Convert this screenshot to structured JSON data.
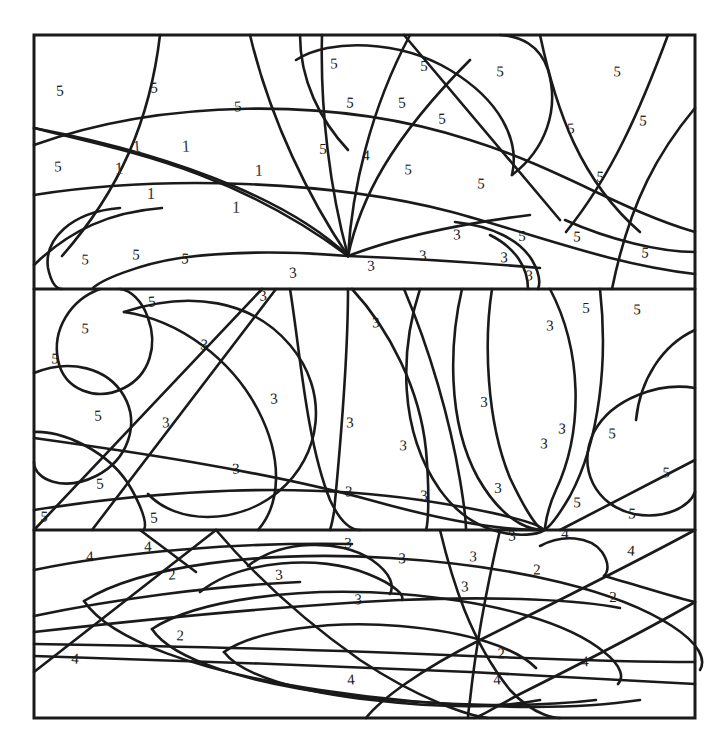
{
  "page": {
    "background_color": "#ffffff",
    "line_color": "#1a1a1a",
    "number_color": "#1a1a1a",
    "width": 727,
    "height": 754
  },
  "frame": {
    "left": 34,
    "top": 35,
    "right": 695,
    "bottom": 718,
    "divider_1_y": 289,
    "divider_2_y": 530
  },
  "legend": {
    "codes": [
      "1",
      "2",
      "3",
      "4",
      "5"
    ]
  },
  "numbers": [
    {
      "value": "5",
      "x": 60,
      "y": 92
    },
    {
      "value": "5",
      "x": 154,
      "y": 89
    },
    {
      "value": "5",
      "x": 238,
      "y": 108
    },
    {
      "value": "5",
      "x": 334,
      "y": 65
    },
    {
      "value": "5",
      "x": 424,
      "y": 68
    },
    {
      "value": "5",
      "x": 500,
      "y": 73
    },
    {
      "value": "5",
      "x": 617,
      "y": 73
    },
    {
      "value": "5",
      "x": 643,
      "y": 122
    },
    {
      "value": "5",
      "x": 350,
      "y": 104
    },
    {
      "value": "5",
      "x": 402,
      "y": 104
    },
    {
      "value": "5",
      "x": 442,
      "y": 120
    },
    {
      "value": "5",
      "x": 571,
      "y": 130
    },
    {
      "value": "5",
      "x": 58,
      "y": 168
    },
    {
      "value": "5",
      "x": 323,
      "y": 151
    },
    {
      "value": "4",
      "x": 366,
      "y": 157
    },
    {
      "value": "5",
      "x": 408,
      "y": 171
    },
    {
      "value": "5",
      "x": 481,
      "y": 185
    },
    {
      "value": "5",
      "x": 600,
      "y": 178
    },
    {
      "value": "1",
      "x": 137,
      "y": 148
    },
    {
      "value": "1",
      "x": 186,
      "y": 148
    },
    {
      "value": "1",
      "x": 119,
      "y": 170
    },
    {
      "value": "1",
      "x": 259,
      "y": 172
    },
    {
      "value": "1",
      "x": 151,
      "y": 195
    },
    {
      "value": "1",
      "x": 236,
      "y": 209
    },
    {
      "value": "5",
      "x": 85,
      "y": 261
    },
    {
      "value": "5",
      "x": 136,
      "y": 256
    },
    {
      "value": "5",
      "x": 185,
      "y": 260
    },
    {
      "value": "3",
      "x": 293,
      "y": 274
    },
    {
      "value": "3",
      "x": 371,
      "y": 267
    },
    {
      "value": "3",
      "x": 423,
      "y": 257
    },
    {
      "value": "3",
      "x": 457,
      "y": 236
    },
    {
      "value": "5",
      "x": 522,
      "y": 238
    },
    {
      "value": "3",
      "x": 504,
      "y": 259
    },
    {
      "value": "3",
      "x": 529,
      "y": 277
    },
    {
      "value": "5",
      "x": 577,
      "y": 238
    },
    {
      "value": "5",
      "x": 645,
      "y": 254
    },
    {
      "value": "5",
      "x": 152,
      "y": 303
    },
    {
      "value": "3",
      "x": 263,
      "y": 297
    },
    {
      "value": "3",
      "x": 376,
      "y": 324
    },
    {
      "value": "3",
      "x": 550,
      "y": 327
    },
    {
      "value": "5",
      "x": 586,
      "y": 310
    },
    {
      "value": "5",
      "x": 637,
      "y": 311
    },
    {
      "value": "5",
      "x": 85,
      "y": 330
    },
    {
      "value": "5",
      "x": 55,
      "y": 360
    },
    {
      "value": "3",
      "x": 204,
      "y": 346
    },
    {
      "value": "3",
      "x": 274,
      "y": 400
    },
    {
      "value": "5",
      "x": 98,
      "y": 417
    },
    {
      "value": "3",
      "x": 166,
      "y": 424
    },
    {
      "value": "3",
      "x": 350,
      "y": 424
    },
    {
      "value": "3",
      "x": 484,
      "y": 404
    },
    {
      "value": "5",
      "x": 612,
      "y": 435
    },
    {
      "value": "3",
      "x": 403,
      "y": 447
    },
    {
      "value": "3",
      "x": 544,
      "y": 445
    },
    {
      "value": "3",
      "x": 562,
      "y": 430
    },
    {
      "value": "5",
      "x": 100,
      "y": 485
    },
    {
      "value": "3",
      "x": 236,
      "y": 470
    },
    {
      "value": "3",
      "x": 349,
      "y": 493
    },
    {
      "value": "3",
      "x": 424,
      "y": 497
    },
    {
      "value": "3",
      "x": 498,
      "y": 490
    },
    {
      "value": "5",
      "x": 577,
      "y": 504
    },
    {
      "value": "5",
      "x": 666,
      "y": 474
    },
    {
      "value": "5",
      "x": 632,
      "y": 515
    },
    {
      "value": "5",
      "x": 44,
      "y": 518
    },
    {
      "value": "5",
      "x": 154,
      "y": 519
    },
    {
      "value": "3",
      "x": 512,
      "y": 537
    },
    {
      "value": "4",
      "x": 90,
      "y": 558
    },
    {
      "value": "4",
      "x": 148,
      "y": 548
    },
    {
      "value": "3",
      "x": 348,
      "y": 545
    },
    {
      "value": "3",
      "x": 402,
      "y": 560
    },
    {
      "value": "3",
      "x": 473,
      "y": 558
    },
    {
      "value": "4",
      "x": 565,
      "y": 535
    },
    {
      "value": "4",
      "x": 631,
      "y": 552
    },
    {
      "value": "2",
      "x": 172,
      "y": 576
    },
    {
      "value": "3",
      "x": 279,
      "y": 576
    },
    {
      "value": "3",
      "x": 465,
      "y": 588
    },
    {
      "value": "2",
      "x": 537,
      "y": 571
    },
    {
      "value": "2",
      "x": 613,
      "y": 599
    },
    {
      "value": "3",
      "x": 358,
      "y": 601
    },
    {
      "value": "2",
      "x": 180,
      "y": 637
    },
    {
      "value": "2",
      "x": 501,
      "y": 655
    },
    {
      "value": "4",
      "x": 75,
      "y": 660
    },
    {
      "value": "4",
      "x": 351,
      "y": 681
    },
    {
      "value": "4",
      "x": 497,
      "y": 681
    },
    {
      "value": "4",
      "x": 585,
      "y": 663
    }
  ]
}
